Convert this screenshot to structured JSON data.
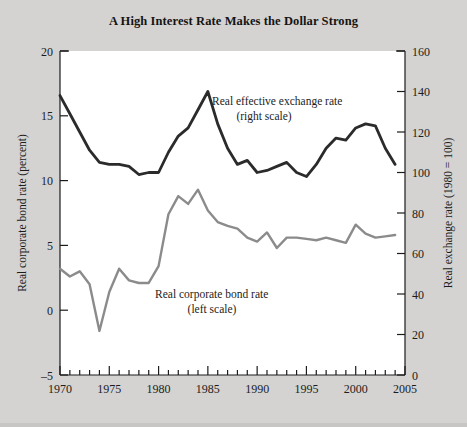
{
  "chart_data": {
    "type": "line",
    "title": "A High Interest Rate Makes the Dollar Strong",
    "xlabel": "",
    "ylabel": "Real corporate bond rate (percent)",
    "y2label": "Real exchange rate (1980 = 100)",
    "grid": false,
    "legend_position": "inline-annotations",
    "xlim": [
      1970,
      2005
    ],
    "xticks": [
      1970,
      1975,
      1980,
      1985,
      1990,
      1995,
      2000,
      2005
    ],
    "xtick_labels": [
      "1970",
      "1975",
      "1980",
      "1985",
      "1990",
      "1995",
      "2000",
      "2005"
    ],
    "xtick_minor_step": 1,
    "ylim": [
      -5,
      20
    ],
    "yticks": [
      -5,
      0,
      5,
      10,
      15,
      20
    ],
    "ytick_labels": [
      "–5",
      "0",
      "5",
      "10",
      "15",
      "20"
    ],
    "y2lim": [
      0,
      160
    ],
    "y2ticks": [
      0,
      20,
      40,
      60,
      80,
      100,
      120,
      140,
      160
    ],
    "y2tick_labels": [
      "0",
      "20",
      "40",
      "60",
      "80",
      "100",
      "120",
      "140",
      "160"
    ],
    "series": [
      {
        "name": "Real effective exchange rate",
        "axis": "right",
        "color": "#2b2b2b",
        "annotation": "Real effective exchange rate",
        "annotation_sub": "(right scale)",
        "x": [
          1970,
          1971,
          1972,
          1973,
          1974,
          1975,
          1976,
          1977,
          1978,
          1979,
          1980,
          1981,
          1982,
          1983,
          1984,
          1985,
          1986,
          1987,
          1988,
          1989,
          1990,
          1991,
          1992,
          1993,
          1994,
          1995,
          1996,
          1997,
          1998,
          1999,
          2000,
          2001,
          2002,
          2003,
          2004
        ],
        "values": [
          138,
          129,
          120,
          111,
          105,
          104,
          104,
          103,
          99,
          100,
          100,
          110,
          118,
          122,
          131,
          140,
          124,
          112,
          104,
          106,
          100,
          101,
          103,
          105,
          100,
          98,
          104,
          112,
          117,
          116,
          122,
          124,
          123,
          112,
          104
        ]
      },
      {
        "name": "Real corporate bond rate",
        "axis": "left",
        "color": "#8b8b8b",
        "annotation": "Real corporate bond rate",
        "annotation_sub": "(left scale)",
        "x": [
          1970,
          1971,
          1972,
          1973,
          1974,
          1975,
          1976,
          1977,
          1978,
          1979,
          1980,
          1981,
          1982,
          1983,
          1984,
          1985,
          1986,
          1987,
          1988,
          1989,
          1990,
          1991,
          1992,
          1993,
          1994,
          1995,
          1996,
          1997,
          1998,
          1999,
          2000,
          2001,
          2002,
          2003,
          2004
        ],
        "values": [
          3.2,
          2.6,
          3.0,
          2.0,
          -1.6,
          1.4,
          3.2,
          2.3,
          2.1,
          2.1,
          3.4,
          7.4,
          8.8,
          8.2,
          9.3,
          7.7,
          6.8,
          6.5,
          6.3,
          5.6,
          5.3,
          6.0,
          4.8,
          5.6,
          5.6,
          5.5,
          5.4,
          5.6,
          5.4,
          5.2,
          6.6,
          5.9,
          5.6,
          5.7,
          5.8
        ]
      }
    ]
  },
  "figure": {
    "background_color": "#d4d3d1",
    "plot_background_color": "#ffffff"
  }
}
